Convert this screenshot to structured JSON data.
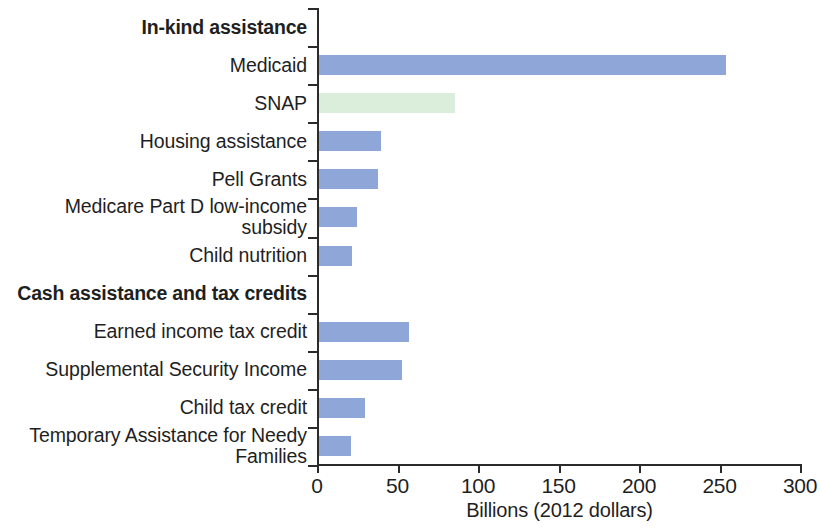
{
  "chart_data": {
    "type": "bar",
    "orientation": "horizontal",
    "title": "",
    "xlabel": "Billions (2012 dollars)",
    "ylabel": "",
    "xlim": [
      0,
      300
    ],
    "xticks": [
      0,
      50,
      100,
      150,
      200,
      250,
      300
    ],
    "xtick_labels": [
      "0",
      "50",
      "100",
      "150",
      "200",
      "250",
      "300"
    ],
    "grid": false,
    "legend": false,
    "categories": [
      "In-kind assistance",
      "Medicaid",
      "SNAP",
      "Housing assistance",
      "Pell Grants",
      "Medicare Part D low-income\nsubsidy",
      "Child nutrition",
      "Cash assistance and tax credits",
      "Earned income tax credit",
      "Supplemental Security Income",
      "Child tax credit",
      "Temporary Assistance for Needy\nFamilies"
    ],
    "values": [
      null,
      254,
      86,
      40,
      38,
      25,
      22,
      null,
      57,
      53,
      30,
      21
    ],
    "rows": [
      {
        "label": "In-kind assistance",
        "value": null,
        "is_group_header": true,
        "color": null
      },
      {
        "label": "Medicaid",
        "value": 254,
        "is_group_header": false,
        "color": "#8fa6d9"
      },
      {
        "label": "SNAP",
        "value": 86,
        "is_group_header": false,
        "color": "#daeedb"
      },
      {
        "label": "Housing assistance",
        "value": 40,
        "is_group_header": false,
        "color": "#8fa6d9"
      },
      {
        "label": "Pell Grants",
        "value": 38,
        "is_group_header": false,
        "color": "#8fa6d9"
      },
      {
        "label": "Medicare Part D low-income\nsubsidy",
        "value": 25,
        "is_group_header": false,
        "color": "#8fa6d9"
      },
      {
        "label": "Child nutrition",
        "value": 22,
        "is_group_header": false,
        "color": "#8fa6d9"
      },
      {
        "label": "Cash assistance and tax credits",
        "value": null,
        "is_group_header": true,
        "color": null
      },
      {
        "label": "Earned income tax credit",
        "value": 57,
        "is_group_header": false,
        "color": "#8fa6d9"
      },
      {
        "label": "Supplemental Security Income",
        "value": 53,
        "is_group_header": false,
        "color": "#8fa6d9"
      },
      {
        "label": "Child tax credit",
        "value": 30,
        "is_group_header": false,
        "color": "#8fa6d9"
      },
      {
        "label": "Temporary Assistance for Needy\nFamilies",
        "value": 21,
        "is_group_header": false,
        "color": "#8fa6d9"
      }
    ],
    "colors": {
      "bar_default": "#8fa6d9",
      "bar_highlight": "#daeedb",
      "axis": "#2b2b2b",
      "text": "#1f1f1f",
      "background": "#ffffff"
    }
  }
}
